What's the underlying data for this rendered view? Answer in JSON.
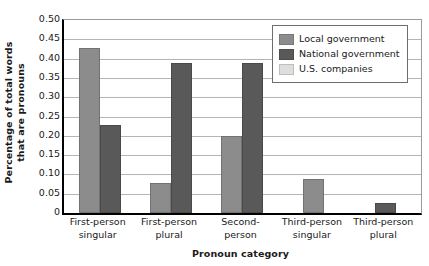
{
  "chart_data": {
    "type": "bar",
    "title": "",
    "xlabel": "Pronoun category",
    "ylabel": "Percentage of total words that are pronouns",
    "ylabel_line1": "Percentage of total words",
    "ylabel_line2": "that are pronouns",
    "ylim": [
      0,
      0.5
    ],
    "ytick_labels": [
      "0.50",
      "0.45",
      "0.40",
      "0.35",
      "0.30",
      "0.25",
      "0.20",
      "0.15",
      "0.10",
      "0.05",
      "0"
    ],
    "ytick_values": [
      0.5,
      0.45,
      0.4,
      0.35,
      0.3,
      0.25,
      0.2,
      0.15,
      0.1,
      0.05,
      0
    ],
    "grid": true,
    "grid_axis": "y",
    "legend_position": "top-right",
    "categories": [
      "First-person singular",
      "First-person plural",
      "Second-person",
      "Third-person singular",
      "Third-person plural"
    ],
    "category_labels": [
      {
        "line1": "First-person",
        "line2": "singular"
      },
      {
        "line1": "First-person",
        "line2": "plural"
      },
      {
        "line1": "Second-",
        "line2": "person"
      },
      {
        "line1": "Third-person",
        "line2": "singular"
      },
      {
        "line1": "Third-person",
        "line2": "plural"
      }
    ],
    "series": [
      {
        "name": "Local government",
        "color": "#8c8c8c",
        "values": [
          0.428,
          0.078,
          0.199,
          0.089,
          null
        ]
      },
      {
        "name": "National government",
        "color": "#595959",
        "values": [
          0.228,
          0.389,
          0.389,
          null,
          0.025
        ]
      },
      {
        "name": "U.S. companies",
        "color": "#dedede",
        "values": [
          null,
          null,
          null,
          null,
          null
        ]
      }
    ]
  },
  "legend": {
    "items": [
      {
        "label": "Local government",
        "color": "#8c8c8c"
      },
      {
        "label": "National government",
        "color": "#595959"
      },
      {
        "label": "U.S. companies",
        "color": "#dedede"
      }
    ]
  }
}
